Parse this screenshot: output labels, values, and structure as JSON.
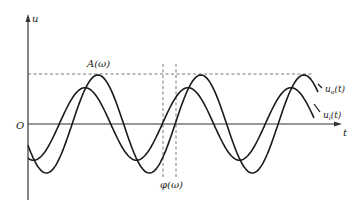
{
  "diagram": {
    "type": "sinusoidal-response",
    "axes": {
      "y_label": "u",
      "x_label": "t",
      "origin_label": "O"
    },
    "annotations": {
      "amplitude_label": "A(ω)",
      "phase_label": "φ(ω)"
    },
    "curves": [
      {
        "name": "output",
        "label_base": "u",
        "label_sub": "o",
        "label_suffix": "(t)",
        "relative_amplitude": 1.0,
        "phase_lag_fraction_of_period": 0.125
      },
      {
        "name": "input",
        "label_base": "u",
        "label_sub": "i",
        "label_suffix": "(t)",
        "relative_amplitude": 0.74,
        "phase_lag_fraction_of_period": 0.0
      }
    ],
    "periods_shown": 2.75,
    "line_color": "#1a1a1a"
  }
}
